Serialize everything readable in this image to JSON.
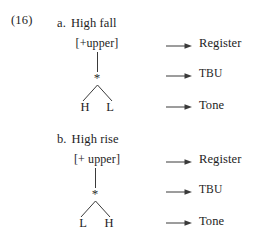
{
  "example": {
    "number": "(16)"
  },
  "colors": {
    "ink": "#1d1d1d",
    "line": "#3a3a3a",
    "background": "#ffffff"
  },
  "items": [
    {
      "marker": "a.",
      "title": "High fall",
      "feature": "[+upper]",
      "tbu": "*",
      "tones": [
        "H",
        "L"
      ],
      "tiers": [
        "Register",
        "TBU",
        "Tone"
      ]
    },
    {
      "marker": "b.",
      "title": "High rise",
      "feature": "[+ upper]",
      "tbu": "*",
      "tones": [
        "L",
        "H"
      ],
      "tiers": [
        "Register",
        "TBU",
        "Tone"
      ]
    }
  ]
}
